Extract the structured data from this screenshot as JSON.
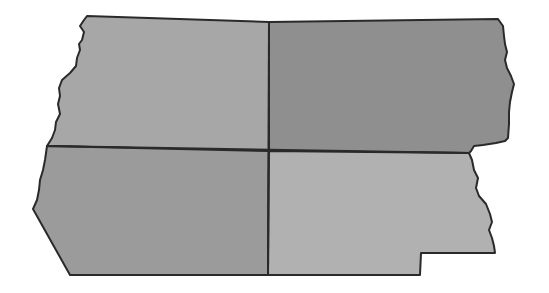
{
  "map": {
    "description": "Outline map of a state divided into four quadrant regions with gray shading",
    "regions": [
      {
        "id": "northwest",
        "fill": "#a7a7a7"
      },
      {
        "id": "northeast",
        "fill": "#8f8f8f"
      },
      {
        "id": "southwest",
        "fill": "#9b9b9b"
      },
      {
        "id": "southeast",
        "fill": "#b1b1b1"
      }
    ],
    "border_color": "#2a2a2a",
    "background": "#ffffff"
  }
}
